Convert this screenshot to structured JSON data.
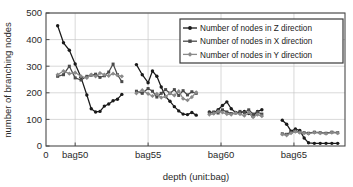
{
  "chart_data": {
    "type": "line",
    "title": "",
    "xlabel": "depth (unit:bag)",
    "ylabel": "number of branching nodes",
    "ylim": [
      0,
      500
    ],
    "yticks": [
      0,
      100,
      200,
      300,
      400,
      500
    ],
    "ytick_labels": [
      "0",
      "100",
      "200",
      "300",
      "400",
      "500"
    ],
    "xlim": [
      48.0,
      68.5
    ],
    "xticks": [
      48.0,
      50.0,
      55.0,
      60.0,
      65.0
    ],
    "xtick_labels": [
      "0",
      "bag50",
      "bag55",
      "bag60",
      "bag65"
    ],
    "grid": true,
    "legend_position": "top-right",
    "series": [
      {
        "name": "Number of nodes in Z direction",
        "color": "#1a1a1a",
        "marker": "filled-circle",
        "segments": [
          {
            "x": [
              48.8,
              49.2,
              49.6,
              50.0,
              50.4,
              50.8,
              51.1,
              51.4,
              51.7,
              52.0,
              52.3,
              52.6,
              52.9,
              53.2
            ],
            "y": [
              452,
              388,
              360,
              308,
              258,
              192,
              140,
              128,
              130,
              150,
              158,
              170,
              176,
              194
            ]
          },
          {
            "x": [
              54.2,
              54.6,
              55.0,
              55.3,
              55.6,
              55.9,
              56.2,
              56.5,
              56.8,
              57.1,
              57.4,
              57.7,
              58.0,
              58.3
            ],
            "y": [
              306,
              268,
              238,
              282,
              262,
              222,
              186,
              168,
              148,
              132,
              120,
              118,
              126,
              116
            ]
          },
          {
            "x": [
              59.2,
              59.5,
              59.8,
              60.1,
              60.4,
              60.7,
              61.0,
              61.3,
              61.6,
              61.9,
              62.2,
              62.5,
              62.8
            ],
            "y": [
              128,
              124,
              136,
              152,
              166,
              140,
              126,
              124,
              130,
              122,
              112,
              130,
              136
            ]
          },
          {
            "x": [
              64.2,
              64.5,
              64.8,
              65.1,
              65.4,
              65.7,
              66.0,
              66.4,
              66.8,
              67.2,
              67.6,
              68.0
            ],
            "y": [
              97,
              82,
              56,
              64,
              58,
              30,
              12,
              10,
              10,
              10,
              10,
              10
            ]
          }
        ]
      },
      {
        "name": "Number of nodes in X direction",
        "color": "#4a4a4a",
        "marker": "filled-square",
        "segments": [
          {
            "x": [
              48.8,
              49.2,
              49.6,
              50.0,
              50.4,
              50.8,
              51.1,
              51.4,
              51.7,
              52.0,
              52.3,
              52.6,
              52.9,
              53.2
            ],
            "y": [
              262,
              268,
              300,
              256,
              248,
              262,
              266,
              270,
              258,
              264,
              278,
              308,
              268,
              242
            ]
          },
          {
            "x": [
              54.2,
              54.6,
              55.0,
              55.3,
              55.6,
              55.9,
              56.2,
              56.5,
              56.8,
              57.1,
              57.4,
              57.7,
              58.0,
              58.3
            ],
            "y": [
              206,
              198,
              216,
              206,
              184,
              198,
              212,
              198,
              212,
              190,
              208,
              192,
              204,
              198
            ]
          },
          {
            "x": [
              59.2,
              59.5,
              59.8,
              60.1,
              60.4,
              60.7,
              61.0,
              61.3,
              61.6,
              61.9,
              62.2,
              62.5,
              62.8
            ],
            "y": [
              124,
              128,
              124,
              136,
              128,
              122,
              124,
              130,
              126,
              136,
              120,
              128,
              120
            ]
          },
          {
            "x": [
              64.2,
              64.5,
              64.8,
              65.1,
              65.4,
              65.7,
              66.0,
              66.4,
              66.8,
              67.2,
              67.6,
              68.0
            ],
            "y": [
              46,
              44,
              52,
              56,
              52,
              50,
              48,
              52,
              50,
              48,
              52,
              50
            ]
          }
        ]
      },
      {
        "name": "Number of nodes in Y direction",
        "color": "#8a8a8a",
        "marker": "filled-diamond",
        "segments": [
          {
            "x": [
              48.8,
              49.2,
              49.6,
              50.0,
              50.4,
              50.8,
              51.1,
              51.4,
              51.7,
              52.0,
              52.3,
              52.6,
              52.9,
              53.2
            ],
            "y": [
              268,
              282,
              272,
              276,
              262,
              256,
              268,
              262,
              274,
              268,
              264,
              272,
              266,
              262
            ]
          },
          {
            "x": [
              54.2,
              54.6,
              55.0,
              55.3,
              55.6,
              55.9,
              56.2,
              56.5,
              56.8,
              57.1,
              57.4,
              57.7,
              58.0,
              58.3
            ],
            "y": [
              198,
              210,
              196,
              188,
              196,
              182,
              186,
              198,
              190,
              206,
              178,
              172,
              184,
              202
            ]
          },
          {
            "x": [
              59.2,
              59.5,
              59.8,
              60.1,
              60.4,
              60.7,
              61.0,
              61.3,
              61.6,
              61.9,
              62.2,
              62.5,
              62.8
            ],
            "y": [
              118,
              122,
              130,
              126,
              120,
              118,
              124,
              120,
              114,
              126,
              108,
              118,
              112
            ]
          },
          {
            "x": [
              64.2,
              64.5,
              64.8,
              65.1,
              65.4,
              65.7,
              66.0,
              66.4,
              66.8,
              67.2,
              67.6,
              68.0
            ],
            "y": [
              44,
              40,
              48,
              54,
              50,
              48,
              46,
              50,
              48,
              46,
              50,
              48
            ]
          }
        ]
      }
    ]
  }
}
